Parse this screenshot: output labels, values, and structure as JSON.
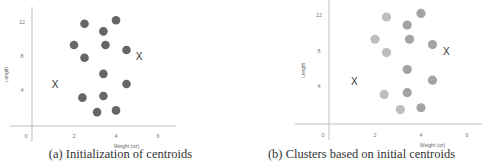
{
  "chart_data": [
    {
      "type": "scatter",
      "title": "",
      "caption": "(a) Initialization of centroids",
      "xlabel": "Weight (oz)",
      "ylabel": "Length",
      "xlim": [
        -1.5,
        7
      ],
      "ylim": [
        -1,
        13.5
      ],
      "xticks": [
        0,
        2,
        4,
        6
      ],
      "yticks": [
        4,
        8,
        12
      ],
      "grid": false,
      "series": [
        {
          "name": "points",
          "color": "#666666",
          "marker": "circle",
          "x": [
            2.5,
            4.0,
            3.4,
            2.0,
            3.5,
            4.5,
            2.5,
            3.4,
            4.5,
            2.4,
            3.4,
            3.1,
            4.0
          ],
          "y": [
            11.8,
            12.2,
            10.9,
            9.3,
            9.3,
            8.7,
            7.8,
            5.9,
            4.7,
            3.1,
            3.3,
            1.4,
            1.6
          ]
        },
        {
          "name": "centroids",
          "color": "#333333",
          "marker": "X",
          "x": [
            1.1,
            5.1
          ],
          "y": [
            4.6,
            7.9
          ]
        }
      ]
    },
    {
      "type": "scatter",
      "title": "",
      "caption": "(b) Clusters based on initial centroids",
      "xlabel": "Weight (oz)",
      "ylabel": "Length",
      "xlim": [
        -1.5,
        7
      ],
      "ylim": [
        -1,
        13.5
      ],
      "xticks": [
        0,
        2,
        4,
        6
      ],
      "yticks": [
        4,
        8,
        12
      ],
      "grid": false,
      "series": [
        {
          "name": "cluster-1 (near left centroid)",
          "color": "#bdbdbd",
          "marker": "circle",
          "x": [
            2.5,
            2.0,
            2.5,
            2.4,
            3.1
          ],
          "y": [
            11.8,
            9.3,
            7.8,
            3.1,
            1.4
          ]
        },
        {
          "name": "cluster-2 (near right centroid)",
          "color": "#a3a3a3",
          "marker": "circle",
          "x": [
            4.0,
            3.4,
            3.5,
            4.5,
            3.4,
            4.5,
            3.4,
            4.0
          ],
          "y": [
            12.2,
            10.9,
            9.3,
            8.7,
            5.9,
            4.7,
            3.3,
            1.6
          ]
        },
        {
          "name": "centroids",
          "color": "#333333",
          "marker": "X",
          "x": [
            1.1,
            5.1
          ],
          "y": [
            4.6,
            7.9
          ]
        }
      ]
    }
  ],
  "panels": {
    "a": {
      "caption": "(a) Initialization of centroids",
      "xlabel": "Weight (oz)",
      "ylabel": "Length"
    },
    "b": {
      "caption": "(b) Clusters based on initial centroids",
      "xlabel": "Weight (oz)",
      "ylabel": "Length"
    }
  }
}
